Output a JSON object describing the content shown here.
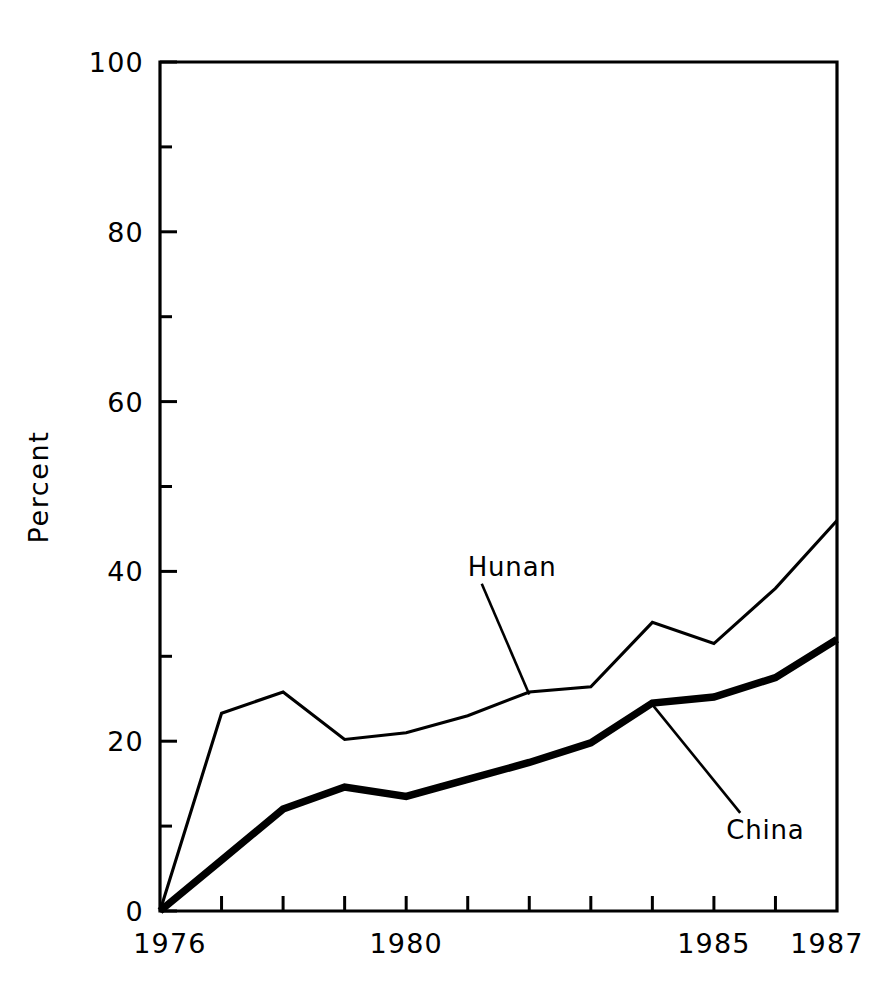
{
  "chart_data": {
    "type": "line",
    "title": "",
    "subtitle": "",
    "xlabel": "",
    "ylabel": "Percent",
    "xlim": [
      1976,
      1987
    ],
    "ylim": [
      0,
      100
    ],
    "grid": false,
    "legend_position": "inline-annotation",
    "x": [
      1976,
      1977,
      1978,
      1979,
      1980,
      1981,
      1982,
      1983,
      1984,
      1985,
      1986,
      1987
    ],
    "x_tick_values": [
      1976,
      1977,
      1978,
      1979,
      1980,
      1981,
      1982,
      1983,
      1984,
      1985,
      1986,
      1987
    ],
    "x_tick_labels": [
      "1976",
      "",
      "",
      "",
      "1980",
      "",
      "",
      "",
      "",
      "1985",
      "",
      "1987"
    ],
    "y_tick_values": [
      0,
      10,
      20,
      30,
      40,
      50,
      60,
      70,
      80,
      90,
      100
    ],
    "y_tick_labels": [
      "0",
      "",
      "20",
      "",
      "40",
      "",
      "60",
      "",
      "80",
      "",
      "100"
    ],
    "series": [
      {
        "name": "Hunan",
        "values": [
          0,
          23.3,
          25.8,
          20.2,
          21.0,
          23.0,
          25.8,
          26.4,
          34.0,
          31.5,
          38.0,
          46.0
        ],
        "line_style": "thin",
        "annotation": {
          "label": "Hunan",
          "label_x": 1981.0,
          "label_y": 39.5,
          "anchor_x": 1982.0,
          "anchor_y": 25.5
        }
      },
      {
        "name": "China",
        "values": [
          0,
          6.0,
          12.0,
          14.6,
          13.5,
          15.5,
          17.5,
          19.8,
          24.5,
          25.2,
          27.5,
          32.0
        ],
        "line_style": "thick",
        "annotation": {
          "label": "China",
          "label_x": 1985.2,
          "label_y": 8.5,
          "anchor_x": 1984.0,
          "anchor_y": 24.3
        }
      }
    ]
  },
  "axis": {
    "y_title": "Percent"
  }
}
